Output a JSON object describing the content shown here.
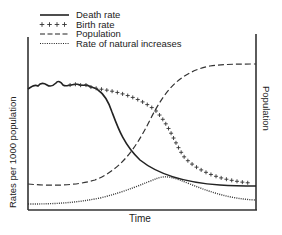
{
  "chart_data": {
    "type": "line",
    "title": "",
    "xlabel": "Time",
    "ylabel": "Rates per 1000 population",
    "ylabel_right": "Population",
    "grid": false,
    "legend_position": "top-left",
    "legend": [
      {
        "label": "Death rate",
        "style": "solid"
      },
      {
        "label": "Birth rate",
        "style": "plus-markers"
      },
      {
        "label": "Population",
        "style": "dashed"
      },
      {
        "label": "Rate of natural increases",
        "style": "dotted"
      }
    ],
    "x": [
      0,
      10,
      20,
      30,
      40,
      50,
      60,
      70,
      80,
      90,
      100
    ],
    "series": [
      {
        "name": "Death rate",
        "values": [
          80,
          82,
          82,
          80,
          76,
          45,
          32,
          26,
          23,
          22,
          21
        ]
      },
      {
        "name": "Birth rate",
        "values": [
          80,
          82,
          82,
          80,
          78,
          72,
          65,
          50,
          33,
          26,
          24
        ]
      },
      {
        "name": "Population",
        "values": [
          14,
          14,
          16,
          22,
          40,
          70,
          85,
          92,
          94,
          95,
          95
        ]
      },
      {
        "name": "Rate of natural increases",
        "values": [
          2,
          2,
          3,
          5,
          10,
          22,
          18,
          14,
          10,
          5,
          3
        ]
      }
    ],
    "axis_ranges": {
      "x": [
        0,
        100
      ],
      "y": [
        0,
        100
      ],
      "y_right": [
        0,
        100
      ]
    }
  },
  "legend": {
    "death": "Death rate",
    "birth": "Birth rate",
    "population": "Population",
    "natural": "Rate of natural increases",
    "birth_marker": "++++"
  },
  "axes": {
    "x_label": "Time",
    "y_left_label": "Rates per 1000 population",
    "y_right_label": "Population"
  }
}
